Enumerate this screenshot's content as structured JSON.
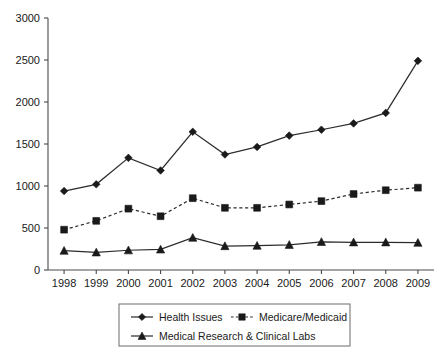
{
  "chart_data": {
    "type": "line",
    "title": "",
    "subtitle": "",
    "xlabel": "",
    "ylabel": "",
    "categories": [
      "1998",
      "1999",
      "2000",
      "2001",
      "2002",
      "2003",
      "2004",
      "2005",
      "2006",
      "2007",
      "2008",
      "2009"
    ],
    "x": [
      1998,
      1999,
      2000,
      2001,
      2002,
      2003,
      2004,
      2005,
      2006,
      2007,
      2008,
      2009
    ],
    "ylim": [
      0,
      3000
    ],
    "y_ticks": [
      0,
      500,
      1000,
      1500,
      2000,
      2500,
      3000
    ],
    "y_tick_labels": [
      "0",
      "500",
      "1000",
      "1500",
      "2000",
      "2500",
      "3000"
    ],
    "grid": false,
    "legend_position": "bottom",
    "series": [
      {
        "name": "Health Issues",
        "marker": "diamond",
        "linestyle": "solid",
        "color": "#1a1a1a",
        "values": [
          940,
          1020,
          1335,
          1185,
          1645,
          1375,
          1465,
          1600,
          1670,
          1745,
          1870,
          2490
        ]
      },
      {
        "name": "Medicare/Medicaid",
        "marker": "square",
        "linestyle": "dashed",
        "color": "#1a1a1a",
        "values": [
          480,
          585,
          730,
          640,
          855,
          740,
          740,
          780,
          820,
          905,
          950,
          980
        ]
      },
      {
        "name": "Medical Research & Clinical Labs",
        "marker": "triangle",
        "linestyle": "solid",
        "color": "#1a1a1a",
        "values": [
          230,
          210,
          235,
          245,
          385,
          285,
          290,
          300,
          335,
          330,
          330,
          325
        ]
      }
    ]
  },
  "legend": {
    "entries": [
      {
        "label": "Health Issues",
        "marker": "diamond",
        "linestyle": "solid"
      },
      {
        "label": "Medicare/Medicaid",
        "marker": "square",
        "linestyle": "dashed"
      },
      {
        "label": "Medical Research & Clinical Labs",
        "marker": "triangle",
        "linestyle": "solid"
      }
    ]
  },
  "colors": {
    "ink": "#1a1a1a",
    "axis": "#4a4a4a",
    "legend_border": "#6b6b6b",
    "background": "#ffffff"
  }
}
